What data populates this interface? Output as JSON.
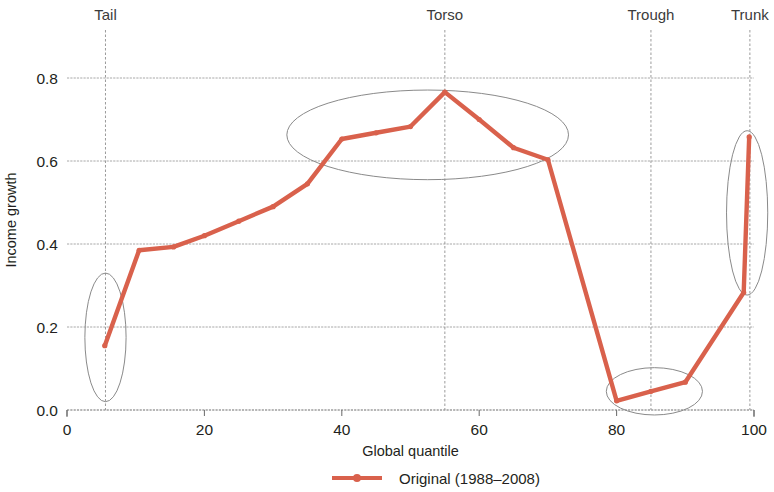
{
  "chart_data": {
    "type": "line",
    "title": "",
    "xlabel": "Global quantile",
    "ylabel": "Income growth",
    "xlim": [
      0,
      100
    ],
    "ylim": [
      0.0,
      0.85
    ],
    "grid": true,
    "legend_position": "bottom-center",
    "x_ticks": [
      {
        "value": 0,
        "label": "0"
      },
      {
        "value": 20,
        "label": "20"
      },
      {
        "value": 40,
        "label": "40"
      },
      {
        "value": 60,
        "label": "60"
      },
      {
        "value": 80,
        "label": "80"
      },
      {
        "value": 100,
        "label": "100"
      }
    ],
    "y_ticks": [
      {
        "value": 0.0,
        "label": "0.0"
      },
      {
        "value": 0.2,
        "label": "0.2"
      },
      {
        "value": 0.4,
        "label": "0.4"
      },
      {
        "value": 0.6,
        "label": "0.6"
      },
      {
        "value": 0.8,
        "label": "0.8"
      }
    ],
    "series": [
      {
        "name": "Original (1988–2008)",
        "color": "#d9614c",
        "marker": "circle",
        "x": [
          5.5,
          10.5,
          15.5,
          20.0,
          25.0,
          30.0,
          35.0,
          40.0,
          45.0,
          50.0,
          55.0,
          60.0,
          65.0,
          70.0,
          80.0,
          85.0,
          90.0,
          98.5,
          99.3
        ],
        "y": [
          0.155,
          0.385,
          0.393,
          0.42,
          0.455,
          0.49,
          0.545,
          0.653,
          0.668,
          0.683,
          0.766,
          0.7,
          0.632,
          0.603,
          0.022,
          0.045,
          0.067,
          0.283,
          0.658
        ],
        "values": [
          0.155,
          0.385,
          0.393,
          0.42,
          0.455,
          0.49,
          0.545,
          0.653,
          0.668,
          0.683,
          0.766,
          0.7,
          0.632,
          0.603,
          0.022,
          0.045,
          0.067,
          0.283,
          0.658
        ]
      }
    ],
    "annotations": [
      {
        "label": "Tail",
        "x": 5.6,
        "ellipse": {
          "cx": 5.6,
          "cy": 0.175,
          "rx": 3.0,
          "ry": 0.155
        }
      },
      {
        "label": "Torso",
        "x": 55.0,
        "ellipse": {
          "cx": 52.5,
          "cy": 0.663,
          "rx": 20.5,
          "ry": 0.108
        }
      },
      {
        "label": "Trough",
        "x": 85.0,
        "ellipse": {
          "cx": 85.5,
          "cy": 0.045,
          "rx": 7.0,
          "ry": 0.057
        }
      },
      {
        "label": "Trunk",
        "x": 99.4,
        "ellipse": {
          "cx": 99.0,
          "cy": 0.475,
          "rx": 3.0,
          "ry": 0.198
        }
      }
    ]
  },
  "legend": {
    "entries": [
      {
        "label": "Original (1988–2008)",
        "color": "#d9614c"
      }
    ]
  }
}
